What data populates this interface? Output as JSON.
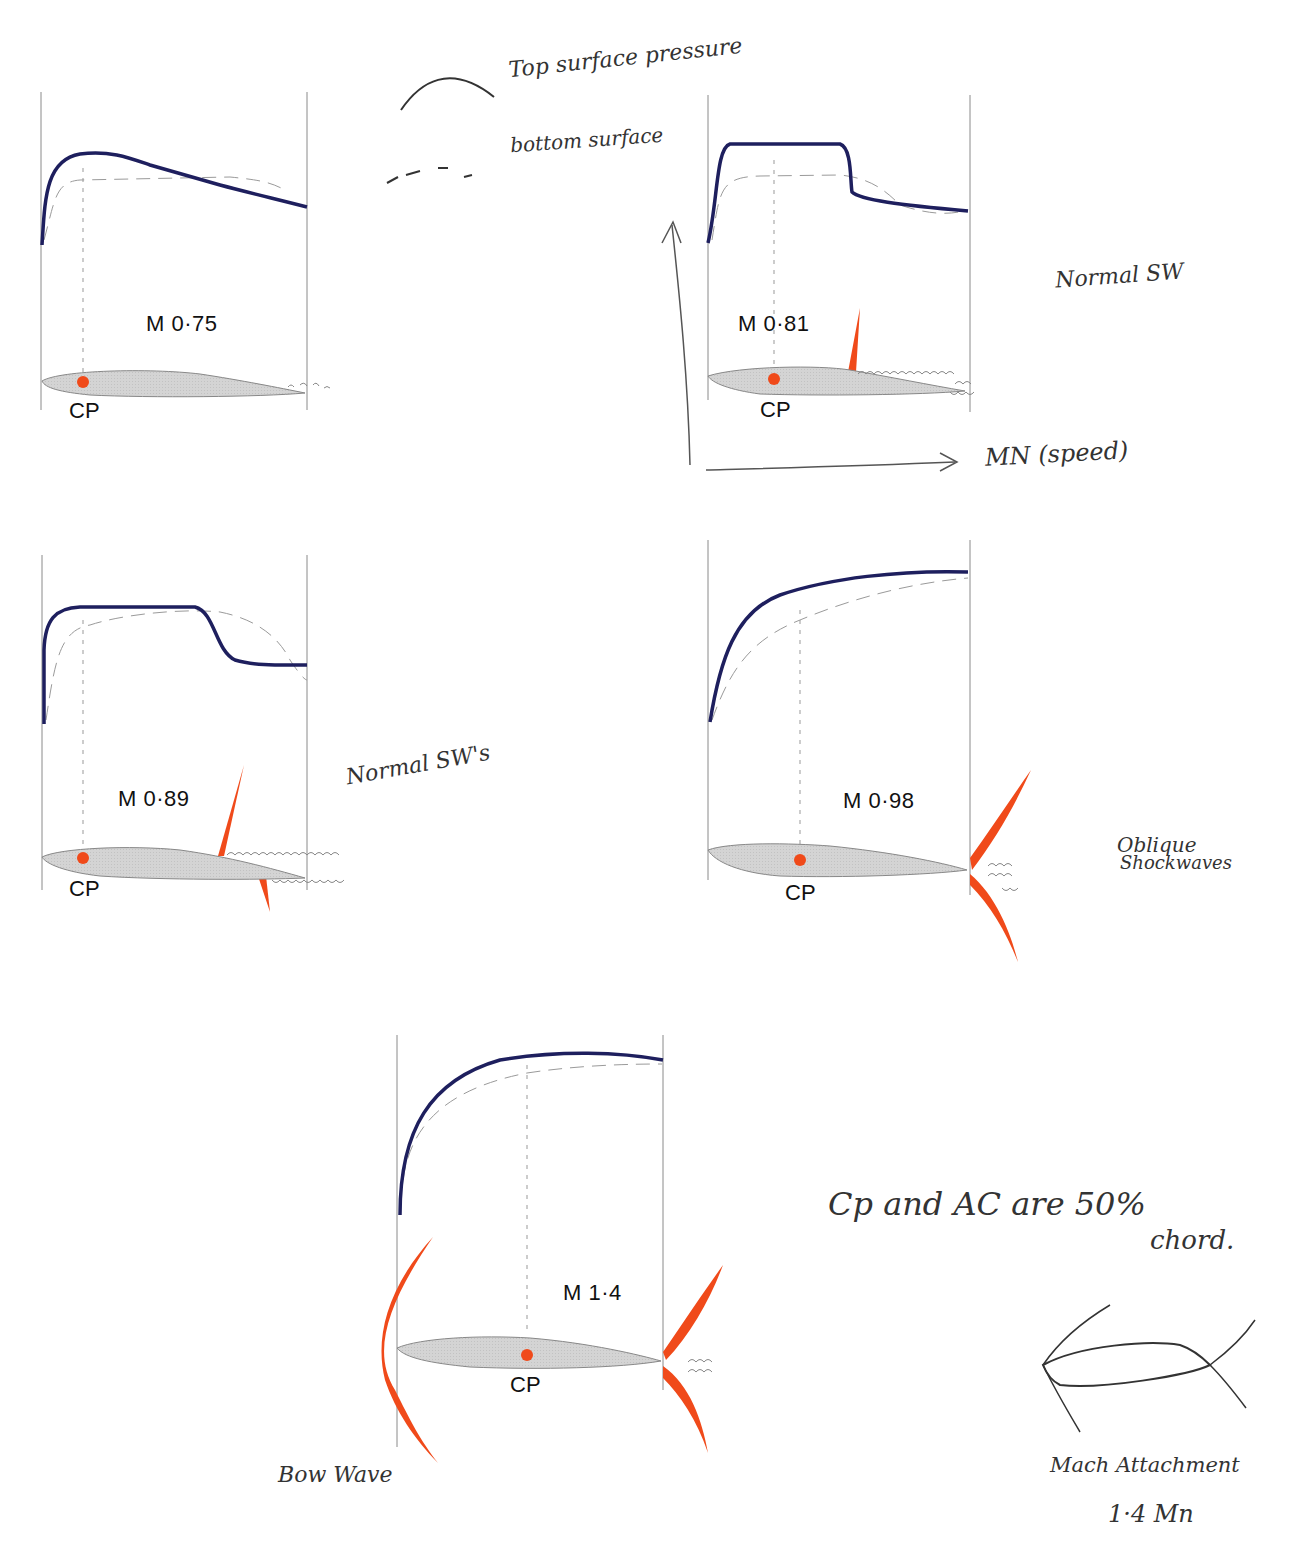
{
  "colors": {
    "top_surface": "#1e1f5e",
    "bottom_surface": "#9a9a9a",
    "shockwave": "#f04a1a",
    "cp_dot": "#f04a1a",
    "airfoil_fill": "#d2d2d2",
    "frame_line": "#8a8a8a",
    "handwriting": "#333333"
  },
  "legend": {
    "top_label": "Top surface pressure",
    "bottom_label": "bottom surface"
  },
  "axes_annotation": {
    "x_label": "MN (speed)"
  },
  "panels": [
    {
      "id": "m075",
      "mach_label": "M 0·75",
      "cp_label": "CP",
      "note": ""
    },
    {
      "id": "m081",
      "mach_label": "M 0·81",
      "cp_label": "CP",
      "note": "Normal SW"
    },
    {
      "id": "m089",
      "mach_label": "M 0·89",
      "cp_label": "CP",
      "note": "Normal SW's"
    },
    {
      "id": "m098",
      "mach_label": "M 0·98",
      "cp_label": "CP",
      "note_line1": "Oblique",
      "note_line2": "Shockwaves"
    },
    {
      "id": "m14",
      "mach_label": "M 1·4",
      "cp_label": "CP",
      "note": "Bow Wave"
    }
  ],
  "notes": {
    "cp_ac_line1": "Cp and AC are 50%",
    "cp_ac_line2": "chord.",
    "mach_attach_line1": "Mach Attachment",
    "mach_attach_line2": "1·4 Mn"
  }
}
